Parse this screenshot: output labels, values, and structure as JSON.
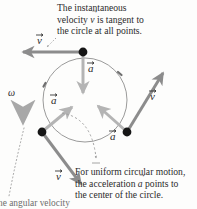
{
  "figure": {
    "captions": {
      "top_line1": "The instantaneous",
      "top_line2_pre": "velocity ",
      "top_line2_sym": "v",
      "top_line2_post": " is tangent to",
      "top_line3": "the circle at all points.",
      "bottom_line1": "For uniform circular motion,",
      "bottom_line2_pre": "the acceleration ",
      "bottom_line2_sym": "a",
      "bottom_line2_post": " points to",
      "bottom_line3": "the center of the circle.",
      "cut_off_line": "he angular velocity"
    },
    "labels": {
      "v_top": "v",
      "v_right": "v",
      "v_bottom": "v",
      "a_top": "a",
      "a_left": "a",
      "a_right": "a",
      "omega": "ω"
    },
    "colors": {
      "text": "#2b2b2b",
      "circle": "#8a8a8a",
      "velocity_vector": "#8c8c8c",
      "acceleration_vector": "#b0b0b0",
      "omega_arrow": "#a8a8a8",
      "point": "#1a1a1a",
      "dashed": "#9a9a9a",
      "background": "#fdfdfc"
    },
    "geometry": {
      "center_x": 85,
      "center_y": 100,
      "radius": 42,
      "points": [
        {
          "name": "top-point",
          "x": 83,
          "y": 52
        },
        {
          "name": "lower-left-point",
          "x": 42,
          "y": 132
        },
        {
          "name": "lower-right-point",
          "x": 127,
          "y": 132
        }
      ],
      "rotation_sense": "counterclockwise"
    }
  }
}
